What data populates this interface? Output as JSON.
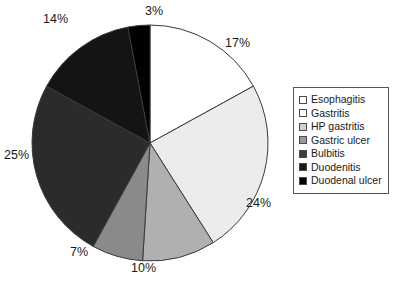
{
  "chart_data": {
    "type": "pie",
    "title": "",
    "subtitle": "",
    "xlabel": "",
    "ylabel": "",
    "grid": false,
    "legend_position": "right",
    "start_angle_deg": 0,
    "direction": "clockwise",
    "categories": [
      "Esophagitis",
      "Gastritis",
      "HP gastritis",
      "Gastric ulcer",
      "Bulbitis",
      "Duodenitis",
      "Duodenal ulcer"
    ],
    "values": [
      17,
      24,
      10,
      7,
      25,
      14,
      3
    ],
    "value_unit": "%",
    "data_labels": [
      "17%",
      "24%",
      "10%",
      "7%",
      "25%",
      "14%",
      "3%"
    ],
    "colors": [
      "#ffffff",
      "#ececec",
      "#b0b0b0",
      "#8a8a8a",
      "#2b2b2b",
      "#141414",
      "#000000"
    ],
    "slice_edge_color": "#3a3a3a",
    "series": [
      {
        "name": "Endoscopic findings",
        "values": [
          17,
          24,
          10,
          7,
          25,
          14,
          3
        ]
      }
    ]
  },
  "pie": {
    "center_x": 150,
    "center_y": 143,
    "radius": 118,
    "labels": [
      {
        "text": "17%",
        "left": 225,
        "top": 36
      },
      {
        "text": "24%",
        "left": 246,
        "top": 196
      },
      {
        "text": "10%",
        "left": 131,
        "top": 261
      },
      {
        "text": "7%",
        "left": 70,
        "top": 245
      },
      {
        "text": "25%",
        "left": 4,
        "top": 148
      },
      {
        "text": "14%",
        "left": 43,
        "top": 12
      },
      {
        "text": "3%",
        "left": 145,
        "top": 4
      }
    ]
  },
  "legend": {
    "items": [
      {
        "label": "Esophagitis",
        "color": "#ffffff"
      },
      {
        "label": "Gastritis",
        "color": "#ffffff"
      },
      {
        "label": "HP gastritis",
        "color": "#d0d0d0"
      },
      {
        "label": "Gastric ulcer",
        "color": "#9a9a9a"
      },
      {
        "label": "Bulbitis",
        "color": "#3c3c3c"
      },
      {
        "label": "Duodenitis",
        "color": "#1a1a1a"
      },
      {
        "label": "Duodenal ulcer",
        "color": "#000000"
      }
    ]
  }
}
